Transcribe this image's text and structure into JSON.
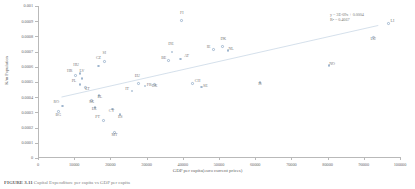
{
  "chart_data": {
    "type": "scatter",
    "title": "",
    "xlabel": "GDP per capita(euro current prices)",
    "ylabel": "K/m Population",
    "xlim": [
      0,
      100000
    ],
    "ylim": [
      0,
      0.001
    ],
    "grid": false,
    "legend": "none",
    "xticks": [
      "0",
      "10000",
      "20000",
      "30000",
      "40000",
      "50000",
      "60000",
      "70000",
      "80000",
      "90000",
      "100000"
    ],
    "yticks": [
      "0",
      "0.0001",
      "0.0002",
      "0.0003",
      "0.0004",
      "0.0005",
      "0.0006",
      "0.0007",
      "0.0008",
      "0.0009",
      "0.001"
    ],
    "annotations": {
      "equation": "y = 3E-09x + 0.0004",
      "r_squared": "R² = 0.4667"
    },
    "trendline": {
      "type": "linear",
      "x0": 6500,
      "y0": 0.000401,
      "x1": 94000,
      "y1": 0.000872
    },
    "points": [
      {
        "label": "RO",
        "x": 6700,
        "y": 0.000342,
        "lx": -6,
        "ly": 0
      },
      {
        "label": "BG",
        "x": 5600,
        "y": 0.000305,
        "lx": 0,
        "ly": 7
      },
      {
        "label": "HR",
        "x": 10400,
        "y": 0.000543,
        "lx": -6,
        "ly": 0
      },
      {
        "label": "HU",
        "x": 11600,
        "y": 0.000557,
        "lx": -4,
        "ly": -4
      },
      {
        "label": "LV",
        "x": 12100,
        "y": 0.000522,
        "lx": 0,
        "ly": -4
      },
      {
        "label": "PL",
        "x": 11600,
        "y": 0.000483,
        "lx": -6,
        "ly": 0
      },
      {
        "label": "LT",
        "x": 13100,
        "y": 0.000463,
        "lx": 2,
        "ly": 5
      },
      {
        "label": "SK",
        "x": 14800,
        "y": 0.00038,
        "lx": 0,
        "ly": 6
      },
      {
        "label": "EE",
        "x": 15800,
        "y": 0.000334,
        "lx": -1,
        "ly": 6
      },
      {
        "label": "CZ",
        "x": 16700,
        "y": 0.000604,
        "lx": 0,
        "ly": -4
      },
      {
        "label": "SI",
        "x": 18300,
        "y": 0.000635,
        "lx": 0,
        "ly": -4
      },
      {
        "label": "EL",
        "x": 16800,
        "y": 0.000411,
        "lx": 1,
        "ly": 5
      },
      {
        "label": "CY",
        "x": 20600,
        "y": 0.000323,
        "lx": -1,
        "ly": 6
      },
      {
        "label": "PT",
        "x": 18100,
        "y": 0.000248,
        "lx": -6,
        "ly": 1
      },
      {
        "label": "ES",
        "x": 22700,
        "y": 0.000285,
        "lx": 0,
        "ly": 6
      },
      {
        "label": "MT",
        "x": 21100,
        "y": 0.000166,
        "lx": 0,
        "ly": 6
      },
      {
        "label": "IT",
        "x": 26000,
        "y": 0.000442,
        "lx": -5,
        "ly": 2
      },
      {
        "label": "EU",
        "x": 27700,
        "y": 0.000489,
        "lx": -1,
        "ly": -4
      },
      {
        "label": "FR",
        "x": 29600,
        "y": 0.000475,
        "lx": 4,
        "ly": 3
      },
      {
        "label": "UK",
        "x": 32200,
        "y": 0.000482,
        "lx": 0,
        "ly": 5
      },
      {
        "label": "BE",
        "x": 36100,
        "y": 0.00064,
        "lx": -5,
        "ly": 1
      },
      {
        "label": "DE",
        "x": 37000,
        "y": 0.000698,
        "lx": -1,
        "ly": -4
      },
      {
        "label": "AT",
        "x": 39400,
        "y": 0.000652,
        "lx": 6,
        "ly": 1
      },
      {
        "label": "FI",
        "x": 39700,
        "y": 0.000904,
        "lx": 0,
        "ly": -4
      },
      {
        "label": "CH",
        "x": 42700,
        "y": 0.000492,
        "lx": 5,
        "ly": 2
      },
      {
        "label": "SE",
        "x": 45100,
        "y": 0.000468,
        "lx": 4,
        "ly": 3
      },
      {
        "label": "IE",
        "x": 48500,
        "y": 0.000712,
        "lx": -5,
        "ly": 1
      },
      {
        "label": "DK",
        "x": 50900,
        "y": 0.000733,
        "lx": 1,
        "ly": -4
      },
      {
        "label": "NL",
        "x": 52500,
        "y": 0.000707,
        "lx": 3,
        "ly": 2
      },
      {
        "label": "IS",
        "x": 61300,
        "y": 0.000498,
        "lx": 0,
        "ly": 6
      },
      {
        "label": "NO",
        "x": 80400,
        "y": 0.000608,
        "lx": 3,
        "ly": 2
      },
      {
        "label": "LU",
        "x": 92600,
        "y": 0.000793,
        "lx": 0,
        "ly": 6
      },
      {
        "label": "LI",
        "x": 96800,
        "y": 0.000886,
        "lx": 4,
        "ly": 2
      }
    ]
  },
  "caption": {
    "prefix": "FIGURE 3.11",
    "text": "Capital Expenditure per capita vs GDP per capita"
  }
}
